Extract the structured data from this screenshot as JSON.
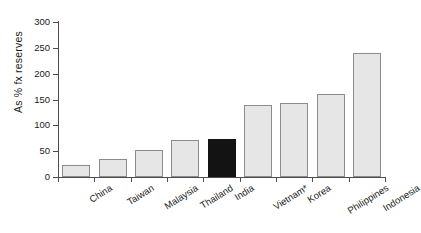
{
  "chart_data": {
    "type": "bar",
    "title": "",
    "xlabel": "",
    "ylabel": "As % fx reserves",
    "ylim": [
      0,
      300
    ],
    "ytick_values": [
      0,
      50,
      100,
      150,
      200,
      250,
      300
    ],
    "ytick_labels": [
      "0",
      "50",
      "100",
      "150",
      "200",
      "250",
      "300"
    ],
    "grid": false,
    "legend": "none",
    "categories": [
      "China",
      "Taiwan",
      "Malaysia",
      "Thailand",
      "India",
      "Vietnam*",
      "Korea",
      "Philippines",
      "Indonesia"
    ],
    "values": [
      23,
      35,
      53,
      71,
      74,
      139,
      144,
      160,
      240
    ],
    "highlight_category": "India",
    "colors": {
      "bar_fill": "#e6e6e6",
      "bar_border": "#8c8c8c",
      "highlight_fill": "#131313",
      "axis": "#4d4d4d",
      "text": "#1a1a1a",
      "background": "#ffffff"
    },
    "annotations": [
      "* Vietnam figure marked with asterisk"
    ]
  }
}
